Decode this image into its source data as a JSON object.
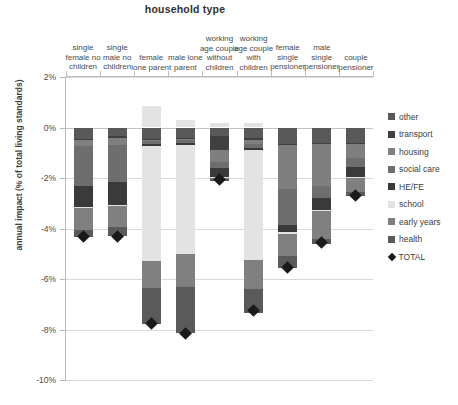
{
  "chart_data": {
    "type": "bar",
    "title": "household type",
    "xlabel": "household type",
    "ylabel": "annual impact (% of total living standards)",
    "ylim": [
      -10,
      2
    ],
    "ytick_labels": [
      "2%",
      "0%",
      "-2%",
      "-4%",
      "-6%",
      "-8%",
      "-10%"
    ],
    "ytick_values": [
      2,
      0,
      -2,
      -4,
      -6,
      -8,
      -10
    ],
    "grid": true,
    "stacked": true,
    "legend_position": "right",
    "categories": [
      "single female no children",
      "single male no children",
      "female lone parent",
      "male lone parent",
      "working age couple without children",
      "working age couple with children",
      "female single pensioner",
      "male single pensioner",
      "couple pensioner"
    ],
    "series": [
      {
        "name": "other",
        "color": "#595959",
        "values": [
          -0.45,
          -0.35,
          -0.45,
          -0.4,
          -0.35,
          -0.4,
          -0.65,
          -0.6,
          -0.6
        ]
      },
      {
        "name": "transport",
        "color": "#404040",
        "values": [
          -0.05,
          -0.08,
          -0.05,
          -0.05,
          -0.55,
          -0.1,
          -0.05,
          -0.05,
          -0.05
        ]
      },
      {
        "name": "housing",
        "color": "#7f7f7f",
        "values": [
          -0.25,
          -0.28,
          -0.05,
          -0.05,
          -0.45,
          -0.15,
          -1.75,
          -1.65,
          -0.55
        ]
      },
      {
        "name": "social care",
        "color": "#6e6e6e",
        "values": [
          -1.55,
          -1.45,
          -0.1,
          -0.1,
          -0.25,
          -0.15,
          -1.4,
          -0.5,
          -0.35
        ]
      },
      {
        "name": "HE/FE",
        "color": "#3a3a3a",
        "values": [
          -0.85,
          -0.9,
          -0.1,
          -0.1,
          -0.35,
          -0.1,
          -0.3,
          -0.45,
          -0.4
        ]
      },
      {
        "name": "school",
        "color": "#e3e3e3",
        "values": [
          -0.05,
          -0.05,
          -4.55,
          -4.3,
          -0.05,
          -4.35,
          -0.05,
          -0.05,
          -0.05
        ]
      },
      {
        "name": "early years",
        "color": "#808080",
        "values": [
          -0.85,
          -0.85,
          -1.05,
          -1.3,
          -0.05,
          -1.15,
          -0.9,
          -1.1,
          -0.55
        ]
      },
      {
        "name": "health",
        "color": "#5a5a5a",
        "values": [
          -0.3,
          -0.35,
          -1.45,
          -1.85,
          -0.05,
          -0.95,
          -0.45,
          -0.2,
          -0.15
        ]
      }
    ],
    "positive_segments": [
      {
        "category": "female lone parent",
        "series": "school",
        "value": 0.85
      },
      {
        "category": "male lone parent",
        "series": "school",
        "value": 0.3
      },
      {
        "category": "working age couple without children",
        "series": "school",
        "value": 0.18
      },
      {
        "category": "working age couple with children",
        "series": "school",
        "value": 0.18
      }
    ],
    "totals": {
      "label": "TOTAL",
      "color": "#1a1a1a",
      "marker": "diamond",
      "values": [
        -4.3,
        -4.3,
        -7.75,
        -8.15,
        -2.05,
        -7.25,
        -5.55,
        -4.55,
        -2.7
      ]
    }
  },
  "legend": {
    "items": [
      {
        "label": "other",
        "swatch": "#595959",
        "type": "swatch"
      },
      {
        "label": "transport",
        "swatch": "#404040",
        "type": "swatch"
      },
      {
        "label": "housing",
        "swatch": "#7f7f7f",
        "type": "swatch"
      },
      {
        "label": "social care",
        "swatch": "#6e6e6e",
        "type": "swatch"
      },
      {
        "label": "HE/FE",
        "swatch": "#3a3a3a",
        "type": "swatch"
      },
      {
        "label": "school",
        "swatch": "#e3e3e3",
        "type": "swatch"
      },
      {
        "label": "early years",
        "swatch": "#808080",
        "type": "swatch"
      },
      {
        "label": "health",
        "swatch": "#5a5a5a",
        "type": "swatch"
      },
      {
        "label": "TOTAL",
        "swatch": "#1a1a1a",
        "type": "diamond"
      }
    ]
  }
}
